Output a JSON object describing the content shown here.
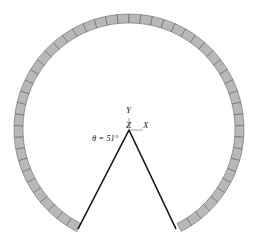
{
  "diagram": {
    "axes": {
      "y_label": "Y",
      "z_label": "Z",
      "x_label": "X"
    },
    "angle_label": "θ = 51°",
    "angle_deg": 51,
    "ring": {
      "segments": 52,
      "fill": "#b8b8b8",
      "stroke": "#555555"
    },
    "line_color": "#111111"
  }
}
